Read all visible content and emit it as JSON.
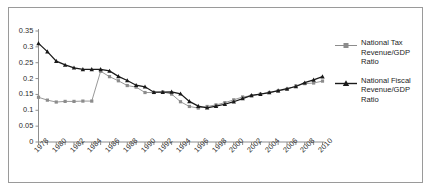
{
  "chart_data": {
    "type": "line",
    "title": "",
    "xlabel": "",
    "ylabel": "",
    "xlim": [
      1978,
      2010
    ],
    "ylim": [
      0,
      0.35
    ],
    "grid": false,
    "legend_position": "right",
    "x": [
      1978,
      1979,
      1980,
      1981,
      1982,
      1983,
      1984,
      1985,
      1986,
      1987,
      1988,
      1989,
      1990,
      1991,
      1992,
      1993,
      1994,
      1995,
      1996,
      1997,
      1998,
      1999,
      2000,
      2001,
      2002,
      2003,
      2004,
      2005,
      2006,
      2007,
      2008,
      2009,
      2010
    ],
    "xtick_labels": [
      "1978",
      "1980",
      "1982",
      "1984",
      "1986",
      "1988",
      "1990",
      "1992",
      "1994",
      "1996",
      "1998",
      "2000",
      "2002",
      "2004",
      "2006",
      "2008",
      "2010"
    ],
    "ytick_labels": [
      "0",
      "0.05",
      "0.1",
      "0.15",
      "0.2",
      "0.25",
      "0.3",
      "0.35"
    ],
    "ytick_values": [
      0,
      0.05,
      0.1,
      0.15,
      0.2,
      0.25,
      0.3,
      0.35
    ],
    "series": [
      {
        "name": "National Tax Revenue/GDP Ratio",
        "color": "#8c8c8c",
        "marker": "square",
        "values": [
          0.141,
          0.132,
          0.126,
          0.128,
          0.128,
          0.129,
          0.129,
          0.223,
          0.206,
          0.193,
          0.178,
          0.173,
          0.156,
          0.156,
          0.158,
          0.151,
          0.127,
          0.112,
          0.107,
          0.112,
          0.117,
          0.124,
          0.133,
          0.142,
          0.146,
          0.151,
          0.156,
          0.161,
          0.166,
          0.177,
          0.184,
          0.186,
          0.192
        ]
      },
      {
        "name": "National Fiscal Revenue/GDP Ratio",
        "color": "#1a1a1a",
        "marker": "triangle",
        "values": [
          0.311,
          0.285,
          0.255,
          0.243,
          0.234,
          0.229,
          0.229,
          0.229,
          0.224,
          0.207,
          0.194,
          0.179,
          0.174,
          0.157,
          0.157,
          0.158,
          0.152,
          0.128,
          0.113,
          0.108,
          0.113,
          0.119,
          0.127,
          0.137,
          0.147,
          0.151,
          0.156,
          0.162,
          0.168,
          0.175,
          0.187,
          0.196,
          0.206
        ]
      }
    ]
  },
  "legend": {
    "entries": [
      {
        "label": "National Tax Revenue/GDP Ratio"
      },
      {
        "label": "National Fiscal Revenue/GDP Ratio"
      }
    ]
  }
}
